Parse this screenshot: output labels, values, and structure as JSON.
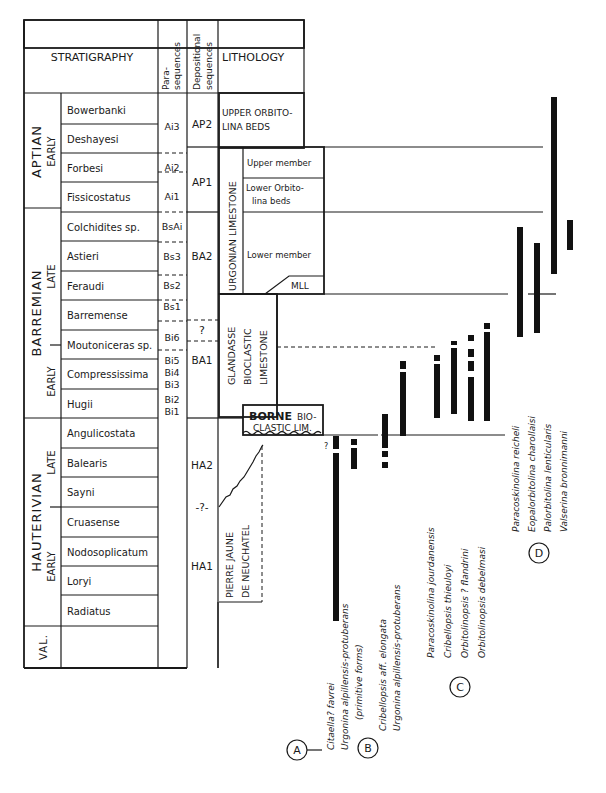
{
  "header": {
    "stratigraphy": "STRATIGRAPHY",
    "parasequences": [
      "Para-",
      "sequences"
    ],
    "depositional": [
      "Depositional",
      "sequences"
    ],
    "lithology": "LITHOLOGY"
  },
  "stages": [
    {
      "name": "APTIAN",
      "sub": "EARLY",
      "y1": 95,
      "y2": 208
    },
    {
      "name": "BARREMIAN",
      "sub_late": "LATE",
      "sub_early": "EARLY",
      "y1": 208,
      "y2": 418
    },
    {
      "name": "HAUTERIVIAN",
      "sub_late": "LATE",
      "sub_early": "EARLY",
      "y1": 418,
      "y2": 626
    },
    {
      "name": "VAL.",
      "y1": 626,
      "y2": 668
    }
  ],
  "zones": [
    {
      "name": "Bowerbanki",
      "y1": 95,
      "y2": 124
    },
    {
      "name": "Deshayesi",
      "y1": 124,
      "y2": 153
    },
    {
      "name": "Forbesi",
      "y1": 153,
      "y2": 182
    },
    {
      "name": "Fissicostatus",
      "y1": 182,
      "y2": 212
    },
    {
      "name": "Colchidites sp.",
      "y1": 212,
      "y2": 241
    },
    {
      "name": "Astieri",
      "y1": 241,
      "y2": 271
    },
    {
      "name": "Feraudi",
      "y1": 271,
      "y2": 300
    },
    {
      "name": "Barremense",
      "y1": 300,
      "y2": 330
    },
    {
      "name": "Moutoniceras sp.",
      "y1": 330,
      "y2": 359
    },
    {
      "name": "Compressissima",
      "y1": 359,
      "y2": 389
    },
    {
      "name": "Hugii",
      "y1": 389,
      "y2": 418
    },
    {
      "name": "Angulicostata",
      "y1": 418,
      "y2": 448
    },
    {
      "name": "Balearis",
      "y1": 448,
      "y2": 477
    },
    {
      "name": "Sayni",
      "y1": 477,
      "y2": 507
    },
    {
      "name": "Cruasense",
      "y1": 507,
      "y2": 537
    },
    {
      "name": "Nodosoplicatum",
      "y1": 537,
      "y2": 566
    },
    {
      "name": "Loryi",
      "y1": 566,
      "y2": 595
    },
    {
      "name": "Radiatus",
      "y1": 595,
      "y2": 626
    },
    {
      "name": "",
      "y1": 626,
      "y2": 668
    }
  ],
  "parasequences": [
    {
      "label": "Ai3",
      "y": 126
    },
    {
      "label": "Ai2",
      "y": 167
    },
    {
      "label": "Ai1",
      "y": 196
    },
    {
      "label": "BsAi",
      "y": 226
    },
    {
      "label": "Bs3",
      "y": 256
    },
    {
      "label": "Bs2",
      "y": 285
    },
    {
      "label": "Bs1",
      "y": 306
    },
    {
      "label": "Bi6",
      "y": 337
    },
    {
      "label": "Bi5",
      "y": 360
    },
    {
      "label": "Bi4",
      "y": 372
    },
    {
      "label": "Bi3",
      "y": 384
    },
    {
      "label": "Bi2",
      "y": 399
    },
    {
      "label": "Bi1",
      "y": 411
    }
  ],
  "depositional_sequences": [
    {
      "label": "AP2",
      "y": 124
    },
    {
      "label": "AP1",
      "y": 182
    },
    {
      "label": "BA2",
      "y": 256
    },
    {
      "label": "?",
      "y": 330
    },
    {
      "label": "BA1",
      "y": 360
    },
    {
      "label": "HA2",
      "y": 465
    },
    {
      "label": "-?-",
      "y": 507
    },
    {
      "label": "HA1",
      "y": 566
    }
  ],
  "lithology": {
    "upper_orbitolina": [
      "UPPER ORBITO-",
      "LINA BEDS"
    ],
    "urgonian": "URGONIAN LIMESTONE",
    "upper_member": "Upper member",
    "lower_orbitolina": [
      "Lower Orbito-",
      "lina beds"
    ],
    "lower_member": "Lower member",
    "mll": "MLL",
    "glandasse": [
      "GLANDASSE",
      "BIOCLASTIC",
      "LIMESTONE"
    ],
    "borne_bold": "BORNE",
    "borne_rest": "BIO-",
    "borne_line2": "CLASTIC LIM.",
    "pierre": [
      "PIERRE JAUNE",
      "DE NEUCHATEL"
    ]
  },
  "groups": [
    {
      "label": "A",
      "species": [
        "Citaella? favrei",
        "Urgonina alpillensis-protuberans",
        "(primitive forms)"
      ]
    },
    {
      "label": "B",
      "species": [
        "Cribellopsis aff. elongata",
        "Urgonina alpillensis-protuberans"
      ]
    },
    {
      "label": "C",
      "species": [
        "Paracoskinolina jourdanensis",
        "Cribellopsis thieuloyi",
        "Orbitolinopsis ? flandrini",
        "Orbitolinopsis debelmasi"
      ]
    },
    {
      "label": "D",
      "species": [
        "Paracoskinolina reicheli",
        "Eopalorbitolina charollaisi",
        "Palorbitolina lenticularis",
        "Valserina bronnimanni"
      ]
    }
  ],
  "question_mark": "?"
}
